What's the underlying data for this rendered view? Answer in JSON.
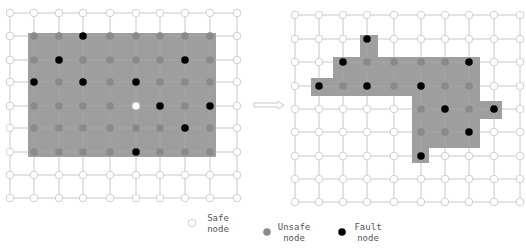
{
  "colors": {
    "region_fill": "#9e9e9e",
    "grid_line": "#d8d8d8",
    "safe_fill": "#ffffff",
    "safe_stroke": "#d0d0d0",
    "unsafe_fill": "#8a8a8a",
    "fault_fill": "#000000",
    "arrow": "#c8c8c8"
  },
  "left_grid": {
    "cols_x": [
      10,
      34,
      59,
      83,
      110,
      136,
      160,
      185,
      210,
      237
    ],
    "rows_y": [
      13,
      36,
      60,
      82,
      106,
      128,
      152,
      175,
      198
    ],
    "regions": [
      {
        "x": 28,
        "y": 33,
        "w": 188,
        "h": 124
      }
    ],
    "nodes": [
      "SSSSSSSSSS",
      "SUUFUUUUUS",
      "SUFUUUUFUS",
      "SFUFUFUUUS",
      "SUUUUSFUFS",
      "SUUUUUUFUS",
      "SUUUUFUUUS",
      "SSSSSSSSSS",
      "SSSSSSSSSS"
    ]
  },
  "right_grid": {
    "cols_x": [
      295,
      319,
      343,
      367,
      394,
      421,
      445,
      469,
      494,
      520
    ],
    "rows_y": [
      15,
      39,
      62,
      86,
      109,
      132,
      156,
      179,
      202
    ],
    "regions": [
      {
        "x": 360,
        "y": 35,
        "w": 18,
        "h": 22
      },
      {
        "x": 333,
        "y": 57,
        "w": 147,
        "h": 22
      },
      {
        "x": 311,
        "y": 78,
        "w": 169,
        "h": 18
      },
      {
        "x": 412,
        "y": 78,
        "w": 68,
        "h": 70
      },
      {
        "x": 478,
        "y": 101,
        "w": 24,
        "h": 18
      },
      {
        "x": 412,
        "y": 146,
        "w": 17,
        "h": 17
      }
    ],
    "nodes": [
      "SSSSSSSSSS",
      "SSSFSSSSSS",
      "SSFUUUUFSS",
      "SFUFUFUUSS",
      "SSSSSUFUFS",
      "SSSSSUUFSS",
      "SSSSSFSSSS",
      "SSSSSSSSSS",
      "SSSSSSSSSS"
    ]
  },
  "arrow": {
    "x1": 254,
    "x2": 284,
    "y": 105
  },
  "legend": [
    {
      "type": "safe",
      "line1": "Safe",
      "line2": "node",
      "dot_x": 192,
      "dot_y": 223,
      "text_x": 198
    },
    {
      "type": "unsafe",
      "line1": "Unsafe",
      "line2": "node",
      "dot_x": 267,
      "dot_y": 232,
      "text_x": 275
    },
    {
      "type": "fault",
      "line1": "Fault",
      "line2": "node",
      "dot_x": 342,
      "dot_y": 232,
      "text_x": 350
    }
  ]
}
